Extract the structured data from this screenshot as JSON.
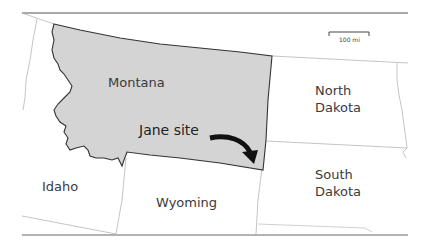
{
  "map": {
    "title": "Jane site location map",
    "highlighted_state": "Montana",
    "highlight_color": "#d4d4d4",
    "border_color": "#333333",
    "minor_border_color": "#9a9a9a",
    "states": [
      {
        "name": "Montana",
        "highlighted": true
      },
      {
        "name": "Idaho",
        "highlighted": false
      },
      {
        "name": "Wyoming",
        "highlighted": false
      },
      {
        "name": "North Dakota",
        "highlighted": false
      },
      {
        "name": "South Dakota",
        "highlighted": false
      }
    ],
    "labels": {
      "montana": "Montana",
      "idaho": "Idaho",
      "wyoming": "Wyoming",
      "north_dakota_line1": "North",
      "north_dakota_line2": "Dakota",
      "south_dakota_line1": "South",
      "south_dakota_line2": "Dakota"
    },
    "annotation": {
      "text": "Jane site",
      "arrow": "curved-arrow-pointing-down-right"
    },
    "scale_bar": {
      "label": "100 mi"
    }
  }
}
